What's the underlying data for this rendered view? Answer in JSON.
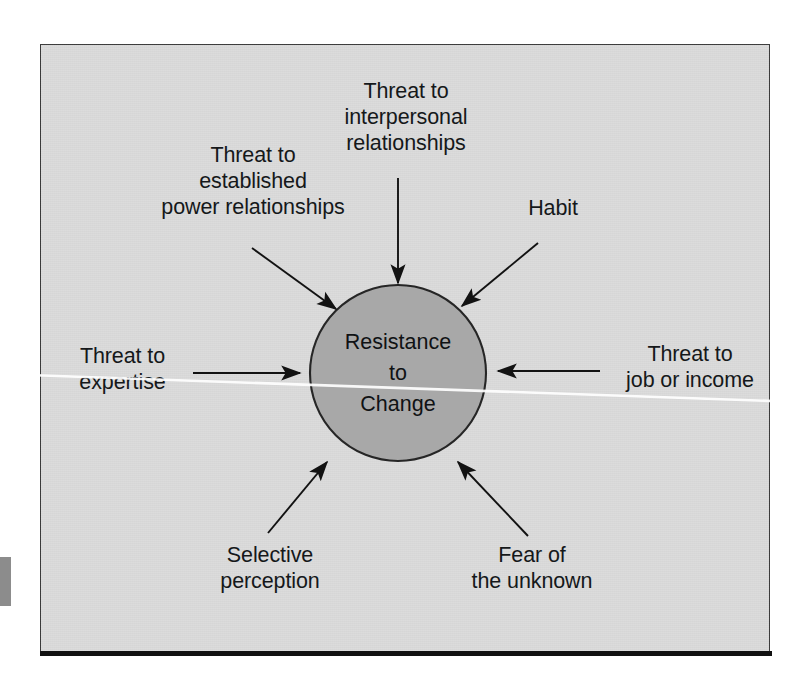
{
  "figure": {
    "center_node": {
      "label": "Resistance\nto\nChange",
      "fill_color": "#a8a8a8",
      "stroke_color": "#262626"
    },
    "panel": {
      "background_color": "#dcdcdc",
      "border_color": "#3a3a3a"
    },
    "factors": [
      {
        "id": "threat-established-power",
        "label": "Threat to\nestablished\npower relationships",
        "position": "top-left",
        "arrow_direction": "down-right"
      },
      {
        "id": "threat-interpersonal",
        "label": "Threat to\ninterpersonal\nrelationships",
        "position": "top-center",
        "arrow_direction": "down"
      },
      {
        "id": "habit",
        "label": "Habit",
        "position": "top-right",
        "arrow_direction": "down-left"
      },
      {
        "id": "threat-expertise",
        "label": "Threat to\nexpertise",
        "position": "left",
        "arrow_direction": "right"
      },
      {
        "id": "threat-job-income",
        "label": "Threat to\njob or income",
        "position": "right",
        "arrow_direction": "left"
      },
      {
        "id": "selective-perception",
        "label": "Selective\nperception",
        "position": "bottom-left",
        "arrow_direction": "up-right"
      },
      {
        "id": "fear-unknown",
        "label": "Fear of\nthe unknown",
        "position": "bottom-right",
        "arrow_direction": "up-left"
      }
    ]
  }
}
